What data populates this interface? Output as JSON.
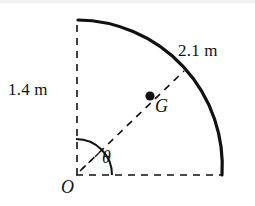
{
  "figure": {
    "labels": {
      "inner_radius": "1.4 m",
      "outer_radius": "2.1 m",
      "centroid_point": "G",
      "origin_point": "O",
      "angle": "θ"
    },
    "colors": {
      "stroke": "#111111",
      "background": "#ffffff",
      "dot_fill": "#111111"
    },
    "geometry": {
      "origin": {
        "x": 76,
        "y": 175
      },
      "inner_radius_px": 157,
      "outer_radius_px": 146,
      "vertical_dash_top": {
        "x": 77,
        "y": 19
      },
      "horizontal_dash_right": {
        "x": 222,
        "y": 175
      },
      "radius_line_end": {
        "x": 184,
        "y": 71
      },
      "centroid_dot": {
        "x": 150,
        "y": 96
      },
      "angle_arc_radius_px": 36,
      "sector_angle_deg": 90
    }
  }
}
